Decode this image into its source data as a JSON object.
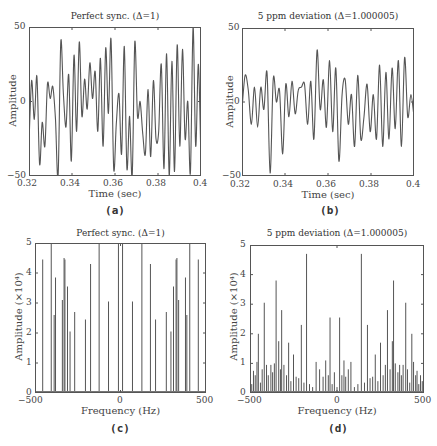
{
  "chart_data": [
    {
      "id": "a",
      "type": "line",
      "title": "Perfect sync. (Δ=1)",
      "xlabel": "Time (sec)",
      "ylabel": "Amplitude",
      "xlim": [
        0.32,
        0.4
      ],
      "ylim": [
        -50,
        50
      ],
      "xticks": [
        "0.32",
        "0.34",
        "0.36",
        "0.38",
        "0.4"
      ],
      "yticks": [
        "50",
        "0",
        "−50"
      ],
      "caption": "(a)",
      "x": [
        0.32,
        0.321,
        0.322,
        0.323,
        0.324,
        0.325,
        0.326,
        0.327,
        0.328,
        0.329,
        0.33,
        0.331,
        0.332,
        0.333,
        0.334,
        0.335,
        0.336,
        0.337,
        0.338,
        0.339,
        0.34,
        0.341,
        0.342,
        0.343,
        0.344,
        0.345,
        0.346,
        0.347,
        0.348,
        0.349,
        0.35,
        0.351,
        0.352,
        0.353,
        0.354,
        0.355,
        0.356,
        0.357,
        0.358,
        0.359,
        0.36,
        0.361,
        0.362,
        0.363,
        0.364,
        0.365,
        0.366,
        0.367,
        0.368,
        0.369,
        0.37,
        0.371,
        0.372,
        0.373,
        0.374,
        0.375,
        0.376,
        0.377,
        0.378,
        0.379,
        0.38,
        0.381,
        0.382,
        0.383,
        0.384,
        0.385,
        0.386,
        0.387,
        0.388,
        0.389,
        0.39,
        0.391,
        0.392,
        0.393,
        0.394,
        0.395,
        0.396,
        0.397,
        0.398,
        0.399,
        0.4
      ],
      "values": [
        -28,
        14,
        -12,
        17,
        -42,
        -14,
        -30,
        12,
        2,
        10,
        -12,
        -50,
        40,
        5,
        -17,
        18,
        -40,
        31,
        -20,
        40,
        -10,
        15,
        -5,
        26,
        2,
        20,
        -20,
        29,
        -30,
        36,
        -8,
        42,
        -45,
        -15,
        5,
        -35,
        37,
        -45,
        -10,
        -50,
        40,
        -10,
        0,
        -22,
        -35,
        8,
        -37,
        14,
        -25,
        -20,
        25,
        -45,
        32,
        -50,
        27,
        -47,
        38,
        -30,
        35,
        -25,
        0,
        -48,
        50,
        -30,
        25,
        -42
      ],
      "color": "#555555"
    },
    {
      "id": "b",
      "type": "line",
      "title": "5 ppm deviation (Δ=1.000005)",
      "xlabel": "Time (sec)",
      "ylabel": "Amplitude",
      "xlim": [
        0.32,
        0.4
      ],
      "ylim": [
        -50,
        50
      ],
      "xticks": [
        "0.32",
        "0.34",
        "0.36",
        "0.38",
        "0.4"
      ],
      "yticks": [
        "50",
        "0",
        "−50"
      ],
      "caption": "(b)",
      "values": [
        -5,
        18,
        8,
        -15,
        10,
        -17,
        10,
        -5,
        20,
        -48,
        16,
        0,
        8,
        -35,
        12,
        -10,
        14,
        -8,
        8,
        10,
        12,
        -15,
        14,
        -25,
        35,
        -5,
        15,
        -17,
        28,
        -20,
        23,
        -40,
        5,
        15,
        -15,
        5,
        -30,
        18,
        -25,
        -10,
        12,
        -20,
        5,
        -25,
        25,
        -30,
        20,
        -25,
        23,
        -18,
        28,
        -30,
        30,
        -10,
        5,
        -10
      ],
      "color": "#555555"
    },
    {
      "id": "c",
      "type": "bar",
      "title": "Perfect sync. (Δ=1)",
      "xlabel": "Frequency (Hz)",
      "ylabel": "Amplitude (×10⁴)",
      "xlim": [
        -500,
        500
      ],
      "ylim": [
        0,
        5
      ],
      "xticks": [
        "−500",
        "0",
        "500"
      ],
      "yticks": [
        "5",
        "4",
        "3",
        "2",
        "1",
        "0"
      ],
      "caption": "(c)",
      "x": [
        -455,
        -405,
        -388,
        -380,
        -340,
        -330,
        -325,
        -310,
        -295,
        -268,
        -205,
        -175,
        -125,
        -70,
        -12,
        12,
        70,
        125,
        175,
        205,
        268,
        295,
        310,
        325,
        330,
        340,
        380,
        388,
        405,
        455
      ],
      "values": [
        4.45,
        5.0,
        2.6,
        3.85,
        3.1,
        4.5,
        4.45,
        3.55,
        2.05,
        2.7,
        2.45,
        4.3,
        5.0,
        3.05,
        5.0,
        5.0,
        3.05,
        5.0,
        4.3,
        2.45,
        2.7,
        2.05,
        3.55,
        4.45,
        4.5,
        3.1,
        3.85,
        2.6,
        5.0,
        4.45
      ],
      "color": "#555555"
    },
    {
      "id": "d",
      "type": "bar",
      "title": "5 ppm deviation (Δ=1.000005)",
      "xlabel": "Frequency (Hz)",
      "ylabel": "Amplitude (×10⁴)",
      "xlim": [
        -500,
        500
      ],
      "ylim": [
        0,
        5
      ],
      "xticks": [
        "−500",
        "0",
        "500"
      ],
      "yticks": [
        "5",
        "4",
        "3",
        "2",
        "1",
        "0"
      ],
      "caption": "(d)",
      "x": [
        -490,
        -480,
        -470,
        -460,
        -452,
        -440,
        -430,
        -418,
        -405,
        -395,
        -380,
        -370,
        -360,
        -350,
        -335,
        -325,
        -318,
        -305,
        -290,
        -278,
        -265,
        -250,
        -235,
        -220,
        -205,
        -190,
        -175,
        -158,
        -140,
        -120,
        -100,
        -80,
        -65,
        -50,
        -40,
        -28,
        -15,
        0,
        15,
        28,
        40,
        50,
        65,
        80,
        100,
        120,
        140,
        158,
        175,
        190,
        205,
        220,
        235,
        250,
        265,
        278,
        290,
        305,
        318,
        325,
        335,
        350,
        360,
        370,
        380,
        395,
        405,
        418,
        430,
        440,
        452,
        460,
        470,
        480,
        490
      ],
      "values": [
        0.3,
        0.75,
        0.6,
        1.05,
        2.0,
        0.35,
        0.8,
        3.05,
        0.95,
        0.6,
        0.95,
        0.7,
        1.0,
        3.8,
        1.75,
        0.8,
        2.8,
        0.95,
        0.6,
        1.7,
        0.4,
        1.3,
        0.55,
        0.5,
        2.3,
        0.35,
        4.7,
        0.3,
        0.2,
        1.05,
        0.8,
        0.55,
        1.1,
        0.6,
        2.55,
        0.3,
        0.7,
        0.2,
        2.55,
        0.6,
        1.1,
        0.55,
        0.8,
        1.05,
        0.2,
        0.3,
        4.7,
        0.35,
        2.3,
        0.5,
        0.55,
        1.3,
        0.4,
        1.7,
        0.6,
        0.95,
        2.8,
        0.8,
        1.75,
        3.8,
        1.0,
        0.7,
        0.95,
        0.6,
        0.95,
        3.05,
        0.8,
        0.35,
        2.0,
        1.05,
        0.6,
        0.75,
        0.3,
        0.6,
        0.4
      ],
      "color": "#555555"
    }
  ]
}
